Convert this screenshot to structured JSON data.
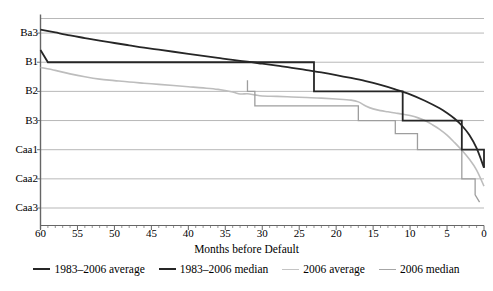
{
  "chart_data": {
    "type": "line",
    "title": "",
    "xlabel": "Months before Default",
    "ylabel": "",
    "x_ticks": [
      60,
      55,
      50,
      45,
      40,
      35,
      30,
      25,
      20,
      15,
      10,
      5,
      0
    ],
    "x_reversed": true,
    "xlim": [
      60,
      0
    ],
    "y_categories": [
      "Ba3",
      "B1",
      "B2",
      "B3",
      "Caa1",
      "Caa2",
      "Caa3"
    ],
    "y_tick_values": [
      1,
      2,
      3,
      4,
      5,
      6,
      7
    ],
    "ylim": [
      0.5,
      7.6
    ],
    "grid": "horizontal",
    "legend_position": "bottom",
    "series": [
      {
        "name": "1983–2006 average",
        "color": "#262626",
        "width": 1.8,
        "style": "smooth",
        "points": [
          [
            60,
            0.88
          ],
          [
            58,
            0.98
          ],
          [
            56,
            1.08
          ],
          [
            54,
            1.17
          ],
          [
            52,
            1.26
          ],
          [
            50,
            1.34
          ],
          [
            48,
            1.42
          ],
          [
            46,
            1.5
          ],
          [
            44,
            1.57
          ],
          [
            42,
            1.64
          ],
          [
            40,
            1.71
          ],
          [
            38,
            1.78
          ],
          [
            36,
            1.85
          ],
          [
            34,
            1.92
          ],
          [
            32,
            1.98
          ],
          [
            30,
            2.05
          ],
          [
            28,
            2.12
          ],
          [
            26,
            2.19
          ],
          [
            24,
            2.27
          ],
          [
            22,
            2.35
          ],
          [
            20,
            2.44
          ],
          [
            18,
            2.54
          ],
          [
            16,
            2.65
          ],
          [
            14,
            2.78
          ],
          [
            12,
            2.93
          ],
          [
            10,
            3.1
          ],
          [
            8,
            3.32
          ],
          [
            6,
            3.58
          ],
          [
            5,
            3.74
          ],
          [
            4,
            3.93
          ],
          [
            3,
            4.17
          ],
          [
            2,
            4.49
          ],
          [
            1,
            4.95
          ],
          [
            0,
            5.62
          ]
        ]
      },
      {
        "name": "1983–2006 median",
        "color": "#262626",
        "width": 1.8,
        "style": "step",
        "points": [
          [
            60,
            1.58
          ],
          [
            59,
            2.0
          ],
          [
            23,
            2.0
          ],
          [
            23,
            3.0
          ],
          [
            11,
            3.0
          ],
          [
            11,
            4.0
          ],
          [
            3,
            4.0
          ],
          [
            3,
            5.0
          ],
          [
            0,
            5.0
          ],
          [
            0,
            5.62
          ]
        ]
      },
      {
        "name": "2006 average",
        "color": "#bdbdbd",
        "width": 1.6,
        "style": "smooth",
        "points": [
          [
            60,
            2.18
          ],
          [
            58,
            2.28
          ],
          [
            56,
            2.4
          ],
          [
            54,
            2.5
          ],
          [
            52,
            2.58
          ],
          [
            50,
            2.63
          ],
          [
            48,
            2.68
          ],
          [
            46,
            2.72
          ],
          [
            44,
            2.76
          ],
          [
            42,
            2.8
          ],
          [
            40,
            2.84
          ],
          [
            38,
            2.88
          ],
          [
            36,
            2.93
          ],
          [
            34,
            3.02
          ],
          [
            33,
            3.09
          ],
          [
            32,
            3.08
          ],
          [
            31,
            3.12
          ],
          [
            30,
            3.16
          ],
          [
            28,
            3.17
          ],
          [
            26,
            3.19
          ],
          [
            24,
            3.21
          ],
          [
            22,
            3.23
          ],
          [
            20,
            3.26
          ],
          [
            18,
            3.3
          ],
          [
            17,
            3.36
          ],
          [
            16,
            3.5
          ],
          [
            15,
            3.6
          ],
          [
            14,
            3.66
          ],
          [
            13,
            3.7
          ],
          [
            12,
            3.74
          ],
          [
            11,
            3.78
          ],
          [
            10,
            3.83
          ],
          [
            9,
            3.9
          ],
          [
            8,
            4.0
          ],
          [
            7,
            4.14
          ],
          [
            6,
            4.3
          ],
          [
            5,
            4.5
          ],
          [
            4,
            4.75
          ],
          [
            3,
            5.02
          ],
          [
            2,
            5.32
          ],
          [
            1,
            5.7
          ],
          [
            0,
            6.25
          ]
        ]
      },
      {
        "name": "2006 median",
        "color": "#9e9e9e",
        "width": 1.3,
        "style": "step",
        "points": [
          [
            32,
            2.62
          ],
          [
            32,
            3.0
          ],
          [
            31,
            3.0
          ],
          [
            31,
            3.5
          ],
          [
            17,
            3.5
          ],
          [
            17,
            4.0
          ],
          [
            12,
            4.0
          ],
          [
            12,
            4.45
          ],
          [
            9,
            4.45
          ],
          [
            9,
            5.0
          ],
          [
            3,
            5.0
          ],
          [
            3,
            6.0
          ],
          [
            1.2,
            6.0
          ],
          [
            1.2,
            6.55
          ],
          [
            0.6,
            6.8
          ]
        ]
      }
    ]
  },
  "axis": {
    "x_title": "Months before Default"
  },
  "legend": {
    "items": [
      {
        "label": "1983–2006 average",
        "color": "#262626",
        "thickness": "2px"
      },
      {
        "label": "1983–2006 median",
        "color": "#262626",
        "thickness": "2px"
      },
      {
        "label": "2006 average",
        "color": "#c4c4c4",
        "thickness": "1.5px"
      },
      {
        "label": "2006 median",
        "color": "#a6a6a6",
        "thickness": "1.5px"
      }
    ]
  },
  "colors": {
    "axis": "#555555",
    "grid": "#9a9a9a",
    "background": "#ffffff"
  }
}
